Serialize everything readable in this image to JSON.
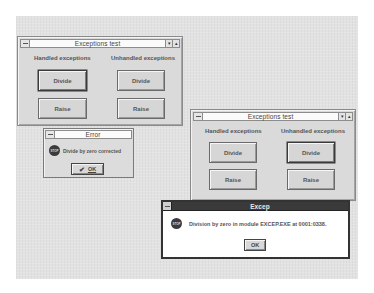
{
  "window1": {
    "title": "Exceptions test",
    "handled_label": "Handled exceptions",
    "unhandled_label": "Unhandled exceptions",
    "handled_divide": "Divide",
    "handled_raise": "Raise",
    "unhandled_divide": "Divide",
    "unhandled_raise": "Raise",
    "minimize_icon": "▾",
    "maximize_icon": "▴"
  },
  "error_dialog": {
    "title": "Error",
    "icon": "STOP",
    "message": "Divide by zero corrected",
    "ok_label": "OK",
    "check_glyph": "✔"
  },
  "window2": {
    "title": "Exceptions test",
    "handled_label": "Handled exceptions",
    "unhandled_label": "Unhandled exceptions",
    "handled_divide": "Divide",
    "handled_raise": "Raise",
    "unhandled_divide": "Divide",
    "unhandled_raise": "Raise",
    "minimize_icon": "▾",
    "maximize_icon": "▴"
  },
  "excep_dialog": {
    "title": "Excep",
    "icon": "STOP",
    "message": "Division by zero in module EXCEP.EXE at 0001:0338.",
    "ok_label": "OK"
  }
}
